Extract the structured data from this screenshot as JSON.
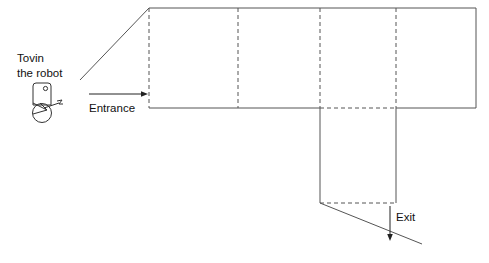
{
  "figure": {
    "type": "floor-plan-line-drawing",
    "background_color": "#ffffff",
    "stroke_color": "#555555",
    "text_color": "#111111"
  },
  "labels": {
    "robot_line1": "Tovin",
    "robot_line2": "the robot",
    "entrance": "Entrance",
    "exit": "Exit",
    "caption": ""
  },
  "icons": {
    "robot": "robot-icon",
    "entrance_arrow": "arrow-right-icon",
    "exit_arrow": "arrow-down-icon"
  },
  "geometry": {
    "room": {
      "top_wall_y": 8,
      "bottom_wall_y": 108,
      "left_wall_x": 149,
      "right_wall_x": 476,
      "left_wall_style": "dashed",
      "top_wall_style": "solid",
      "right_wall_style": "solid",
      "bottom_wall_style": "solid-with-dashed-gap"
    },
    "dividers_x": [
      238,
      320,
      396
    ],
    "divider_style": "dashed",
    "corridor": {
      "left_x": 320,
      "right_x": 396,
      "top_y": 108,
      "bottom_y": 203,
      "bottom_style": "dashed"
    },
    "entrance_diagonal": {
      "x1": 80,
      "y1": 80,
      "x2": 149,
      "y2": 8
    },
    "exit_diagonal": {
      "x1": 320,
      "y1": 203,
      "x2": 422,
      "y2": 244
    },
    "entrance_arrow": {
      "x1": 89,
      "y1": 94,
      "x2": 148,
      "y2": 94
    },
    "exit_arrow": {
      "x1": 390,
      "y1": 206,
      "x2": 390,
      "y2": 241
    }
  }
}
